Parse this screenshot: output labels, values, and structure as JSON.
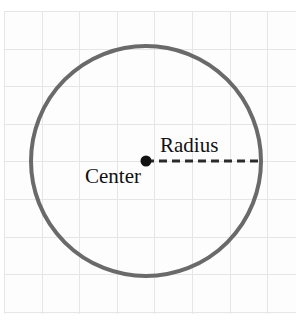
{
  "diagram": {
    "background": {
      "kind": "graph-paper",
      "paper_color": "#fdfdfd",
      "page_color": "#ffffff",
      "minor_gridline_color": "#cfcfcf",
      "major_gridline_color": "#e6e6e6",
      "gridline_style": "dotted",
      "cell_size_px": 37.6
    },
    "shape": {
      "name": "circle",
      "stroke_color": "#6a6a6a",
      "stroke_width_px": 4,
      "fill": "none",
      "center_x": 146,
      "center_y": 161,
      "radius_px": 115
    },
    "center_point": {
      "name": "center-dot",
      "color": "#111111",
      "x": 146,
      "y": 161,
      "diameter_px": 11
    },
    "radius_line": {
      "name": "radius-segment",
      "style": "dashed",
      "color": "#2b2b2b",
      "stroke_width_px": 3,
      "dash_px": 8,
      "gap_px": 5,
      "from_x": 146,
      "from_y": 161,
      "to_x": 261,
      "to_y": 161
    },
    "labels": {
      "radius": "Radius",
      "center": "Center"
    }
  }
}
